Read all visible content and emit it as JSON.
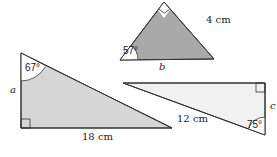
{
  "colors": {
    "dark_fill": "#a9a9a9",
    "light_fill": "#d9d9d9",
    "lighter_fill": "#f0f0f0",
    "stroke": "#333333"
  },
  "triangles": [
    {
      "id": "top",
      "side_label": "4 cm",
      "unknown_label": "b",
      "angle_label": "57°"
    },
    {
      "id": "left",
      "side_label": "18 cm",
      "unknown_label": "a",
      "angle_label": "67°"
    },
    {
      "id": "right",
      "side_label": "12 cm",
      "unknown_label": "c",
      "angle_label": "75°"
    }
  ]
}
